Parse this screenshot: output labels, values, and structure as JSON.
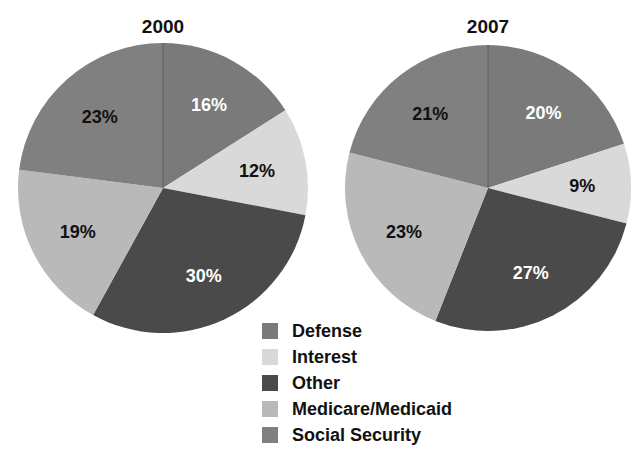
{
  "chart_data": [
    {
      "type": "pie",
      "title": "2000",
      "start_angle_deg": 0,
      "direction": "clockwise",
      "slices": [
        {
          "label": "Defense",
          "value": 16
        },
        {
          "label": "Interest",
          "value": 12
        },
        {
          "label": "Other",
          "value": 30
        },
        {
          "label": "Medicare/Medicaid",
          "value": 19
        },
        {
          "label": "Social Security",
          "value": 23
        }
      ]
    },
    {
      "type": "pie",
      "title": "2007",
      "start_angle_deg": 0,
      "direction": "clockwise",
      "slices": [
        {
          "label": "Defense",
          "value": 20
        },
        {
          "label": "Interest",
          "value": 9
        },
        {
          "label": "Other",
          "value": 27
        },
        {
          "label": "Medicare/Medicaid",
          "value": 23
        },
        {
          "label": "Social Security",
          "value": 21
        }
      ]
    }
  ],
  "legend": {
    "position": "bottom-center",
    "items": [
      {
        "label": "Defense",
        "color": "#7a7a7a"
      },
      {
        "label": "Interest",
        "color": "#d9d9d9"
      },
      {
        "label": "Other",
        "color": "#4a4a4a"
      },
      {
        "label": "Medicare/Medicaid",
        "color": "#b9b9b9"
      },
      {
        "label": "Social Security",
        "color": "#808080"
      }
    ]
  },
  "label_colors": {
    "Defense": "#ffffff",
    "Interest": "#111111",
    "Other": "#ffffff",
    "Medicare/Medicaid": "#111111",
    "Social Security": "#111111"
  }
}
